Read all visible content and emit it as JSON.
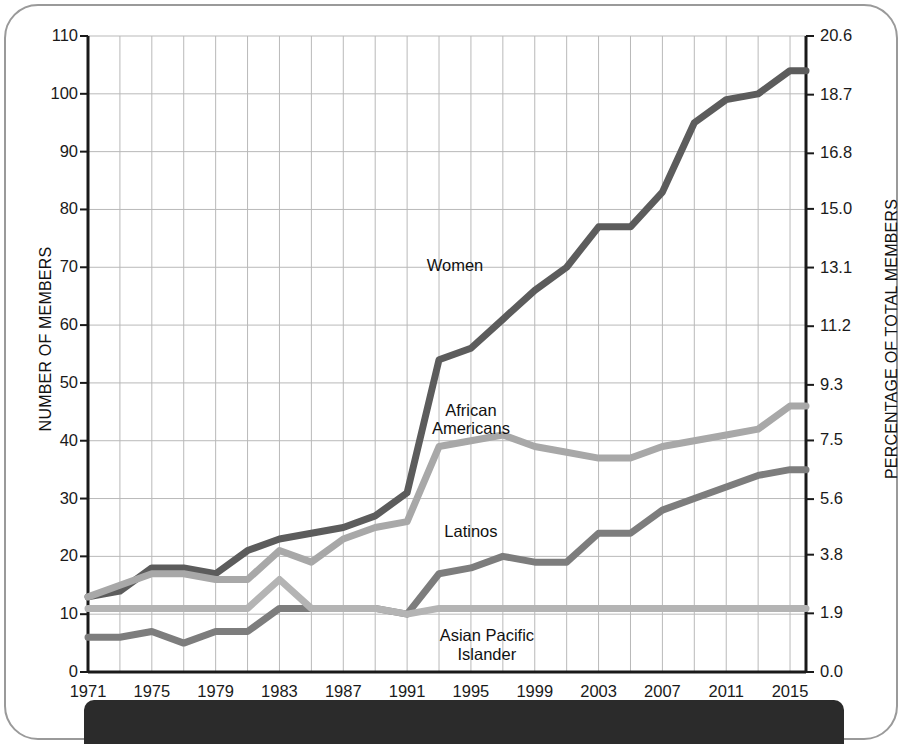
{
  "figure": {
    "left_axis_title": "NUMBER OF MEMBERS",
    "right_axis_title": "PERCENTAGE OF TOTAL MEMBERS"
  },
  "colors": {
    "women": "#5c5c5c",
    "african_americans": "#a8a8a8",
    "latinos": "#7d7d7d",
    "asian_pacific_islander": "#b4b4b4",
    "grid": "#b9b9b9",
    "axis": "#1a1a1a",
    "frame": "#9a9a9a",
    "footer_bar": "#2b2b2b"
  },
  "chart_data": {
    "type": "line",
    "title": "",
    "xlabel": "",
    "ylabel": "NUMBER OF MEMBERS",
    "y2label": "PERCENTAGE OF TOTAL MEMBERS",
    "grid": true,
    "legend": "inline-labels",
    "xlim": [
      1971,
      2016
    ],
    "ylim": [
      0,
      110
    ],
    "y2lim": [
      0.0,
      20.6
    ],
    "x_tick_labels": [
      "1971",
      "1975",
      "1979",
      "1983",
      "1987",
      "1991",
      "1995",
      "1999",
      "2003",
      "2007",
      "2011",
      "2015"
    ],
    "x_tick_values": [
      1971,
      1975,
      1979,
      1983,
      1987,
      1991,
      1995,
      1999,
      2003,
      2007,
      2011,
      2015
    ],
    "x_gridline_values": [
      1971,
      1973,
      1975,
      1977,
      1979,
      1981,
      1983,
      1985,
      1987,
      1989,
      1991,
      1993,
      1995,
      1997,
      1999,
      2001,
      2003,
      2005,
      2007,
      2009,
      2011,
      2013,
      2015
    ],
    "y_tick_labels": [
      "0",
      "10",
      "20",
      "30",
      "40",
      "50",
      "60",
      "70",
      "80",
      "90",
      "100",
      "110"
    ],
    "y_tick_values": [
      0,
      10,
      20,
      30,
      40,
      50,
      60,
      70,
      80,
      90,
      100,
      110
    ],
    "y2_tick_labels": [
      "0.0",
      "1.9",
      "3.8",
      "5.6",
      "7.5",
      "9.3",
      "11.2",
      "13.1",
      "15.0",
      "16.8",
      "18.7",
      "20.6"
    ],
    "y2_tick_values": [
      0.0,
      1.9,
      3.8,
      5.6,
      7.5,
      9.3,
      11.2,
      13.1,
      15.0,
      16.8,
      18.7,
      20.6
    ],
    "x": [
      1971,
      1973,
      1975,
      1977,
      1979,
      1981,
      1983,
      1985,
      1987,
      1989,
      1991,
      1993,
      1995,
      1997,
      1999,
      2001,
      2003,
      2005,
      2007,
      2009,
      2011,
      2013,
      2015,
      2016
    ],
    "series": [
      {
        "name": "Women",
        "color": "#5c5c5c",
        "label_text": "Women",
        "label_x": 1994,
        "label_y": 70,
        "values": [
          13,
          14,
          18,
          18,
          17,
          21,
          23,
          24,
          25,
          27,
          31,
          54,
          56,
          61,
          66,
          70,
          77,
          77,
          83,
          95,
          99,
          100,
          104,
          104
        ]
      },
      {
        "name": "African Americans",
        "color": "#a8a8a8",
        "label_text": "African\nAmericans",
        "label_line1": "African",
        "label_line2": "Americans",
        "label_x": 1995,
        "label_y": 45,
        "values": [
          13,
          15,
          17,
          17,
          16,
          16,
          21,
          19,
          23,
          25,
          26,
          39,
          40,
          41,
          39,
          38,
          37,
          37,
          39,
          40,
          41,
          42,
          46,
          46
        ]
      },
      {
        "name": "Latinos",
        "color": "#7d7d7d",
        "label_text": "Latinos",
        "label_x": 1995,
        "label_y": 24,
        "values": [
          6,
          6,
          7,
          5,
          7,
          7,
          11,
          11,
          11,
          11,
          10,
          17,
          18,
          20,
          19,
          19,
          24,
          24,
          28,
          30,
          32,
          34,
          35,
          35
        ]
      },
      {
        "name": "Asian Pacific Islander",
        "color": "#b4b4b4",
        "label_text": "Asian Pacific\nIslander",
        "label_line1": "Asian Pacific",
        "label_line2": "Islander",
        "label_x": 1996,
        "label_y": 6,
        "values": [
          11,
          11,
          11,
          11,
          11,
          11,
          16,
          11,
          11,
          11,
          10,
          11,
          11,
          11,
          11,
          11,
          11,
          11,
          11,
          11,
          11,
          11,
          11,
          11
        ]
      }
    ]
  }
}
